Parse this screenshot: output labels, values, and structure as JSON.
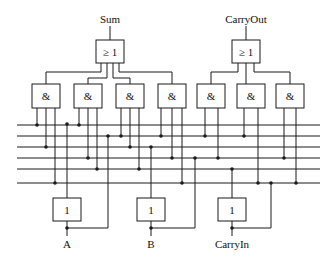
{
  "diagram": {
    "outputs": [
      {
        "id": "sum",
        "label": "Sum"
      },
      {
        "id": "carryout",
        "label": "CarryOut"
      }
    ],
    "inputs": [
      {
        "id": "a",
        "label": "A"
      },
      {
        "id": "b",
        "label": "B"
      },
      {
        "id": "carryin",
        "label": "CarryIn"
      }
    ],
    "or_gates": [
      {
        "id": "or-sum",
        "symbol": "≥ 1"
      },
      {
        "id": "or-carryout",
        "symbol": "≥ 1"
      }
    ],
    "and_gates": [
      {
        "id": "and-1",
        "symbol": "&"
      },
      {
        "id": "and-2",
        "symbol": "&"
      },
      {
        "id": "and-3",
        "symbol": "&"
      },
      {
        "id": "and-4",
        "symbol": "&"
      },
      {
        "id": "and-5",
        "symbol": "&"
      },
      {
        "id": "and-6",
        "symbol": "&"
      },
      {
        "id": "and-7",
        "symbol": "&"
      }
    ],
    "not_gates": [
      {
        "id": "not-a",
        "symbol": "1"
      },
      {
        "id": "not-b",
        "symbol": "1"
      },
      {
        "id": "not-carryin",
        "symbol": "1"
      }
    ],
    "bus_line_count": 6,
    "colors": {
      "stroke": "#1a1a1a",
      "background": "#ffffff"
    }
  }
}
